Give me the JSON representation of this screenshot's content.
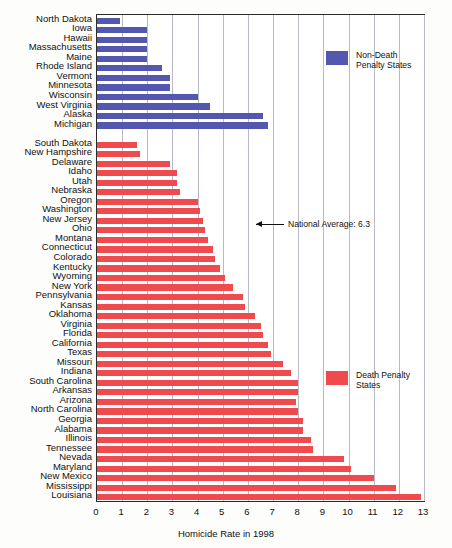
{
  "chart_data": {
    "type": "bar",
    "orientation": "horizontal",
    "title": "",
    "xlabel": "Homicide Rate in 1998",
    "ylabel": "",
    "xlim": [
      0,
      13
    ],
    "xticks": [
      0,
      1,
      2,
      3,
      4,
      5,
      6,
      7,
      8,
      9,
      10,
      11,
      12,
      13
    ],
    "grid": true,
    "legend_position": "inside-right",
    "series": [
      {
        "name": "Non-Death Penalty States",
        "color": "#5457b0",
        "categories": [
          "North Dakota",
          "Iowa",
          "Hawaii",
          "Massachusetts",
          "Maine",
          "Rhode Island",
          "Vermont",
          "Minnesota",
          "Wisconsin",
          "West Virginia",
          "Alaska",
          "Michigan"
        ],
        "values": [
          0.9,
          2.0,
          2.0,
          2.0,
          2.0,
          2.6,
          2.9,
          2.9,
          4.0,
          4.5,
          6.6,
          6.8
        ]
      },
      {
        "name": "Death Penalty States",
        "color": "#ef4b4f",
        "categories": [
          "South Dakota",
          "New Hampshire",
          "Delaware",
          "Idaho",
          "Utah",
          "Nebraska",
          "Oregon",
          "Washington",
          "New Jersey",
          "Ohio",
          "Montana",
          "Connecticut",
          "Colorado",
          "Kentucky",
          "Wyoming",
          "New York",
          "Pennsylvania",
          "Kansas",
          "Oklahoma",
          "Virginia",
          "Florida",
          "California",
          "Texas",
          "Missouri",
          "Indiana",
          "South Carolina",
          "Arkansas",
          "Arizona",
          "North Carolina",
          "Georgia",
          "Alabama",
          "Illinois",
          "Tennessee",
          "Nevada",
          "Maryland",
          "New Mexico",
          "Mississippi",
          "Louisiana"
        ],
        "values": [
          1.6,
          1.7,
          2.9,
          3.2,
          3.2,
          3.3,
          4.0,
          4.1,
          4.2,
          4.3,
          4.4,
          4.6,
          4.7,
          4.9,
          5.1,
          5.4,
          5.8,
          5.9,
          6.3,
          6.5,
          6.6,
          6.8,
          6.9,
          7.4,
          7.7,
          8.0,
          8.0,
          7.9,
          8.0,
          8.2,
          8.2,
          8.5,
          8.6,
          9.8,
          10.1,
          11.0,
          11.9,
          12.9
        ]
      }
    ],
    "annotations": [
      {
        "name": "national-average",
        "label": "National Average: 6.3",
        "value": 6.3
      }
    ]
  },
  "legend": {
    "entries": [
      {
        "label_line1": "Non-Death",
        "label_line2": "Penalty States",
        "color": "#5457b0"
      },
      {
        "label_line1": "Death Penalty",
        "label_line2": "States",
        "color": "#ef4b4f"
      }
    ]
  },
  "axis": {
    "x_title": "Homicide Rate in 1998",
    "tick_labels": [
      "0",
      "1",
      "2",
      "3",
      "4",
      "5",
      "6",
      "7",
      "8",
      "9",
      "10",
      "11",
      "12",
      "13"
    ]
  }
}
